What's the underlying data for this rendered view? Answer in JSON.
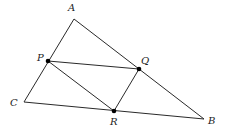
{
  "diagram": {
    "type": "geometry",
    "points": {
      "A": {
        "label": "A",
        "x": 74,
        "y": 19,
        "lx": 68,
        "ly": 11,
        "dot": false
      },
      "B": {
        "label": "B",
        "x": 204,
        "y": 119,
        "lx": 208,
        "ly": 124,
        "dot": false
      },
      "C": {
        "label": "C",
        "x": 24,
        "y": 102,
        "lx": 10,
        "ly": 106,
        "dot": false
      },
      "P": {
        "label": "P",
        "x": 48,
        "y": 61,
        "lx": 37,
        "ly": 61,
        "dot": true
      },
      "Q": {
        "label": "Q",
        "x": 139,
        "y": 69,
        "lx": 141,
        "ly": 64,
        "dot": true
      },
      "R": {
        "label": "R",
        "x": 114,
        "y": 111,
        "lx": 110,
        "ly": 125,
        "dot": true
      }
    },
    "segments": [
      [
        "A",
        "C"
      ],
      [
        "A",
        "B"
      ],
      [
        "C",
        "B"
      ],
      [
        "P",
        "Q"
      ],
      [
        "P",
        "R"
      ],
      [
        "Q",
        "R"
      ]
    ],
    "colors": {
      "line": "#2a2a2a",
      "point": "#000000",
      "label": "#222222",
      "background": "#ffffff"
    }
  }
}
